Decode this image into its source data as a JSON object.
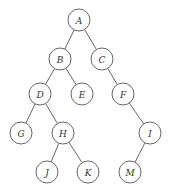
{
  "diagram": {
    "type": "binary-tree",
    "node_radius": 11,
    "colors": {
      "stroke": "#555555",
      "fill": "#ffffff",
      "text": "#333333"
    },
    "nodes": [
      {
        "id": "A",
        "label": "A",
        "x": 79,
        "y": 20
      },
      {
        "id": "B",
        "label": "B",
        "x": 60,
        "y": 59
      },
      {
        "id": "C",
        "label": "C",
        "x": 102,
        "y": 59
      },
      {
        "id": "D",
        "label": "D",
        "x": 40,
        "y": 94
      },
      {
        "id": "E",
        "label": "E",
        "x": 82,
        "y": 94
      },
      {
        "id": "F",
        "label": "F",
        "x": 123,
        "y": 94
      },
      {
        "id": "G",
        "label": "G",
        "x": 21,
        "y": 133
      },
      {
        "id": "H",
        "label": "H",
        "x": 63,
        "y": 133
      },
      {
        "id": "I",
        "label": "I",
        "x": 150,
        "y": 133
      },
      {
        "id": "J",
        "label": "J",
        "x": 47,
        "y": 172
      },
      {
        "id": "K",
        "label": "K",
        "x": 88,
        "y": 172
      },
      {
        "id": "M",
        "label": "M",
        "x": 130,
        "y": 172
      }
    ],
    "edges": [
      [
        "A",
        "B"
      ],
      [
        "A",
        "C"
      ],
      [
        "B",
        "D"
      ],
      [
        "B",
        "E"
      ],
      [
        "C",
        "F"
      ],
      [
        "D",
        "G"
      ],
      [
        "D",
        "H"
      ],
      [
        "F",
        "I"
      ],
      [
        "H",
        "J"
      ],
      [
        "H",
        "K"
      ],
      [
        "I",
        "M"
      ]
    ]
  }
}
